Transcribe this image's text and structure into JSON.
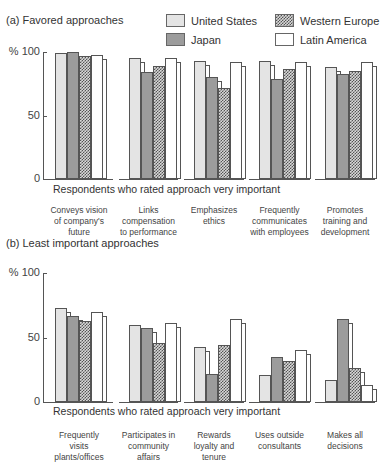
{
  "chart_data": [
    {
      "type": "bar",
      "title": "(a) Favored approaches",
      "xlabel": "Respondents who rated approach very important",
      "ylabel": "%",
      "ylim": [
        0,
        100
      ],
      "yticks": [
        "100",
        "50",
        "0"
      ],
      "ytick_prefix": "%",
      "categories": [
        "Conveys vision of company's future",
        "Links compensation to performance",
        "Emphasizes ethics",
        "Frequently communicates with employees",
        "Promotes training and development"
      ],
      "category_lines": [
        [
          "Conveys vision",
          "of company's",
          "future"
        ],
        [
          "Links",
          "compensation",
          "to performance"
        ],
        [
          "Emphasizes",
          "ethics"
        ],
        [
          "Frequently",
          "communicates",
          "with employees"
        ],
        [
          "Promotes",
          "training and",
          "development"
        ]
      ],
      "series": [
        {
          "name": "United States",
          "values": [
            99,
            95,
            93,
            93,
            88
          ]
        },
        {
          "name": "Japan",
          "values": [
            100,
            84,
            80,
            79,
            83
          ]
        },
        {
          "name": "Western Europe",
          "values": [
            97,
            89,
            72,
            87,
            85
          ]
        },
        {
          "name": "Latin America",
          "values": [
            98,
            95,
            92,
            92,
            92
          ]
        }
      ],
      "grid": false,
      "legend_position": "top-right"
    },
    {
      "type": "bar",
      "title": "(b) Least important approaches",
      "xlabel": "Respondents who rated approach very important",
      "ylabel": "%",
      "ylim": [
        0,
        100
      ],
      "yticks": [
        "100",
        "50",
        "0"
      ],
      "ytick_prefix": "%",
      "categories": [
        "Frequently visits plants/offices",
        "Participates in community affairs",
        "Rewards loyalty and tenure",
        "Uses outside consultants",
        "Makes all decisions"
      ],
      "category_lines": [
        [
          "Frequently",
          "visits",
          "plants/offices"
        ],
        [
          "Participates in",
          "community",
          "affairs"
        ],
        [
          "Rewards",
          "loyalty and",
          "tenure"
        ],
        [
          "Uses outside",
          "consultants"
        ],
        [
          "Makes all",
          "decisions"
        ]
      ],
      "series": [
        {
          "name": "United States",
          "values": [
            73,
            60,
            43,
            21,
            17
          ]
        },
        {
          "name": "Japan",
          "values": [
            67,
            57,
            22,
            35,
            64
          ]
        },
        {
          "name": "Western Europe",
          "values": [
            63,
            46,
            44,
            32,
            26
          ]
        },
        {
          "name": "Latin America",
          "values": [
            70,
            61,
            64,
            40,
            13
          ]
        }
      ],
      "grid": false
    }
  ],
  "legend": [
    {
      "name": "United States",
      "key": "us"
    },
    {
      "name": "Japan",
      "key": "jp"
    },
    {
      "name": "Western Europe",
      "key": "we"
    },
    {
      "name": "Latin America",
      "key": "la"
    }
  ]
}
